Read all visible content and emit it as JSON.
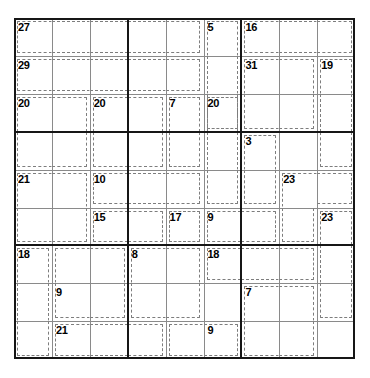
{
  "puzzle": {
    "type": "killer-sudoku",
    "title": "Killer Sudoku Grid",
    "grid_size": 9,
    "cell_px": 37.9,
    "grid_origin": {
      "x": 14,
      "y": 18
    },
    "colors": {
      "background": "#ffffff",
      "thin_line": "#8a8a8a",
      "thick_line": "#161616",
      "cage_dash": "#7d7d7d",
      "clue_text": "#000000"
    },
    "filled_cells": [],
    "cages": [
      {
        "id": "cage-27",
        "sum": "27",
        "clue_cell": {
          "r": 1,
          "c": 1
        },
        "cells": [
          [
            1,
            1
          ],
          [
            1,
            2
          ],
          [
            1,
            3
          ],
          [
            1,
            4
          ],
          [
            1,
            5
          ]
        ]
      },
      {
        "id": "cage-5",
        "sum": "5",
        "clue_cell": {
          "r": 1,
          "c": 6
        },
        "cells": [
          [
            1,
            6
          ],
          [
            2,
            6
          ],
          [
            3,
            6
          ]
        ]
      },
      {
        "id": "cage-16",
        "sum": "16",
        "clue_cell": {
          "r": 1,
          "c": 7
        },
        "cells": [
          [
            1,
            7
          ],
          [
            1,
            8
          ],
          [
            1,
            9
          ]
        ]
      },
      {
        "id": "cage-29",
        "sum": "29",
        "clue_cell": {
          "r": 2,
          "c": 1
        },
        "cells": [
          [
            2,
            1
          ],
          [
            2,
            2
          ],
          [
            2,
            3
          ],
          [
            2,
            4
          ],
          [
            2,
            5
          ]
        ]
      },
      {
        "id": "cage-31",
        "sum": "31",
        "clue_cell": {
          "r": 2,
          "c": 7
        },
        "cells": [
          [
            2,
            7
          ],
          [
            2,
            8
          ],
          [
            3,
            7
          ],
          [
            3,
            8
          ]
        ]
      },
      {
        "id": "cage-19",
        "sum": "19",
        "clue_cell": {
          "r": 2,
          "c": 9
        },
        "cells": [
          [
            2,
            9
          ],
          [
            3,
            9
          ],
          [
            4,
            9
          ]
        ]
      },
      {
        "id": "cage-20a",
        "sum": "20",
        "clue_cell": {
          "r": 3,
          "c": 1
        },
        "cells": [
          [
            3,
            1
          ],
          [
            3,
            2
          ],
          [
            4,
            1
          ],
          [
            4,
            2
          ]
        ]
      },
      {
        "id": "cage-20b",
        "sum": "20",
        "clue_cell": {
          "r": 3,
          "c": 3
        },
        "cells": [
          [
            3,
            3
          ],
          [
            3,
            4
          ],
          [
            4,
            3
          ],
          [
            4,
            4
          ]
        ]
      },
      {
        "id": "cage-7",
        "sum": "7",
        "clue_cell": {
          "r": 3,
          "c": 5
        },
        "cells": [
          [
            3,
            5
          ],
          [
            4,
            5
          ]
        ]
      },
      {
        "id": "cage-20c",
        "sum": "20",
        "clue_cell": {
          "r": 3,
          "c": 6
        },
        "cells": [
          [
            3,
            6
          ],
          [
            4,
            6
          ],
          [
            5,
            6
          ]
        ]
      },
      {
        "id": "cage-3",
        "sum": "3",
        "clue_cell": {
          "r": 4,
          "c": 7
        },
        "cells": [
          [
            4,
            7
          ],
          [
            5,
            7
          ]
        ]
      },
      {
        "id": "cage-21",
        "sum": "21",
        "clue_cell": {
          "r": 5,
          "c": 1
        },
        "cells": [
          [
            5,
            1
          ],
          [
            5,
            2
          ],
          [
            6,
            1
          ],
          [
            6,
            2
          ]
        ]
      },
      {
        "id": "cage-10",
        "sum": "10",
        "clue_cell": {
          "r": 5,
          "c": 3
        },
        "cells": [
          [
            5,
            3
          ],
          [
            5,
            4
          ],
          [
            5,
            5
          ]
        ]
      },
      {
        "id": "cage-23a",
        "sum": "23",
        "clue_cell": {
          "r": 5,
          "c": 8
        },
        "cells": [
          [
            5,
            8
          ],
          [
            5,
            9
          ],
          [
            6,
            8
          ]
        ]
      },
      {
        "id": "cage-15",
        "sum": "15",
        "clue_cell": {
          "r": 6,
          "c": 3
        },
        "cells": [
          [
            6,
            3
          ],
          [
            6,
            4
          ]
        ]
      },
      {
        "id": "cage-17",
        "sum": "17",
        "clue_cell": {
          "r": 6,
          "c": 5
        },
        "cells": [
          [
            6,
            5
          ]
        ]
      },
      {
        "id": "cage-9a",
        "sum": "9",
        "clue_cell": {
          "r": 6,
          "c": 6
        },
        "cells": [
          [
            6,
            6
          ],
          [
            6,
            7
          ]
        ]
      },
      {
        "id": "cage-23b",
        "sum": "23",
        "clue_cell": {
          "r": 6,
          "c": 9
        },
        "cells": [
          [
            6,
            9
          ],
          [
            7,
            9
          ],
          [
            8,
            9
          ]
        ]
      },
      {
        "id": "cage-18a",
        "sum": "18",
        "clue_cell": {
          "r": 7,
          "c": 1
        },
        "cells": [
          [
            7,
            1
          ],
          [
            8,
            1
          ],
          [
            9,
            1
          ]
        ]
      },
      {
        "id": "cage-8",
        "sum": "8",
        "clue_cell": {
          "r": 7,
          "c": 4
        },
        "cells": [
          [
            7,
            4
          ],
          [
            7,
            5
          ],
          [
            8,
            4
          ],
          [
            8,
            5
          ]
        ]
      },
      {
        "id": "cage-18b",
        "sum": "18",
        "clue_cell": {
          "r": 7,
          "c": 6
        },
        "cells": [
          [
            7,
            6
          ],
          [
            7,
            7
          ],
          [
            7,
            8
          ]
        ]
      },
      {
        "id": "cage-9b",
        "sum": "9",
        "clue_cell": {
          "r": 8,
          "c": 2
        },
        "cells": [
          [
            8,
            2
          ],
          [
            8,
            3
          ],
          [
            7,
            2
          ],
          [
            7,
            3
          ]
        ]
      },
      {
        "id": "cage-7b",
        "sum": "7",
        "clue_cell": {
          "r": 8,
          "c": 7
        },
        "cells": [
          [
            8,
            7
          ],
          [
            8,
            8
          ],
          [
            9,
            7
          ],
          [
            9,
            8
          ]
        ]
      },
      {
        "id": "cage-21b",
        "sum": "21",
        "clue_cell": {
          "r": 9,
          "c": 2
        },
        "cells": [
          [
            9,
            2
          ],
          [
            9,
            3
          ],
          [
            9,
            4
          ]
        ]
      },
      {
        "id": "cage-9c",
        "sum": "9",
        "clue_cell": {
          "r": 9,
          "c": 6
        },
        "cells": [
          [
            9,
            5
          ],
          [
            9,
            6
          ]
        ]
      }
    ]
  }
}
